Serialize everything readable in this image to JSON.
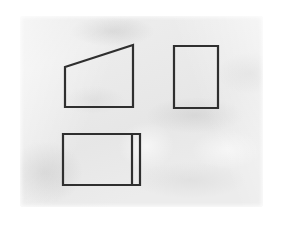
{
  "scene": {
    "title": "Three outlined shapes drawn on a sheet of crumpled paper",
    "background_color": "#ffffff",
    "paper_color": "#ececec",
    "stroke_color": "#2f2f2f",
    "stroke_width": 2.2,
    "paper_rect": {
      "x": 20,
      "y": 16,
      "width": 243,
      "height": 191
    }
  },
  "shapes": [
    {
      "name": "quadrilateral-top-left",
      "type": "polygon",
      "description": "right trapezoid with slanted top edge rising left-to-right",
      "points": [
        [
          65,
          67
        ],
        [
          133,
          45
        ],
        [
          133,
          107
        ],
        [
          65,
          107
        ]
      ]
    },
    {
      "name": "rectangle-top-right",
      "type": "polygon",
      "description": "portrait rectangle",
      "points": [
        [
          174,
          46
        ],
        [
          218,
          46
        ],
        [
          218,
          108
        ],
        [
          174,
          108
        ]
      ]
    },
    {
      "name": "rectangle-bottom-left",
      "type": "polygon",
      "description": "landscape rectangle with inner vertical divider near right edge",
      "points": [
        [
          63,
          134
        ],
        [
          140,
          134
        ],
        [
          140,
          185
        ],
        [
          63,
          185
        ]
      ]
    },
    {
      "name": "vertical-divider-bottom-left",
      "type": "line",
      "description": "inner vertical line creating narrow strip at right side of bottom rectangle",
      "points": [
        [
          132,
          135
        ],
        [
          132,
          184
        ]
      ]
    }
  ]
}
